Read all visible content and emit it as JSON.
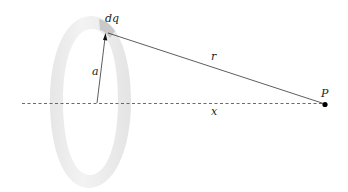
{
  "diagram": {
    "type": "charged-ring-field-point",
    "labels": {
      "dq": "dq",
      "a": "a",
      "r": "r",
      "x": "x",
      "P": "P"
    },
    "colors": {
      "ring": "#ededed",
      "ring_edge": "#e2e2e2",
      "charge_element": "#c9c9c9",
      "lines": "#333333",
      "point": "#000000"
    }
  }
}
